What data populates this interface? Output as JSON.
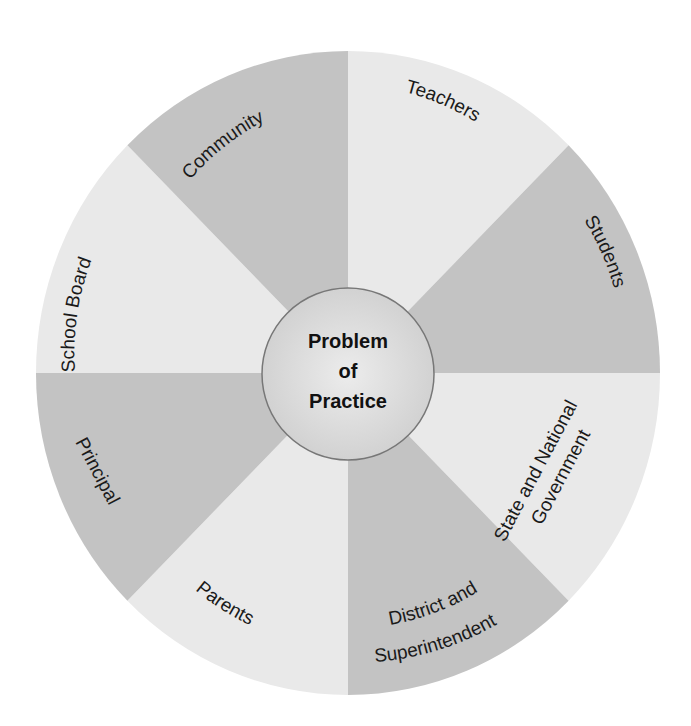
{
  "diagram": {
    "type": "radial-wheel",
    "center_label": {
      "line1": "Problem",
      "line2": "of",
      "line3": "Practice"
    },
    "colors": {
      "dark_wedge": "#c3c3c3",
      "light_wedge": "#e9e9e9",
      "center_fill": "#dcdcdc",
      "center_stroke": "#777777",
      "text": "#1a1a1a"
    },
    "segments": [
      {
        "id": "teachers",
        "label": "Teachers",
        "shade": "light"
      },
      {
        "id": "students",
        "label": "Students",
        "shade": "dark"
      },
      {
        "id": "state",
        "label_line1": "State and National",
        "label_line2": "Government",
        "shade": "light"
      },
      {
        "id": "district",
        "label_line1": "District and",
        "label_line2": "Superintendent",
        "shade": "dark"
      },
      {
        "id": "parents",
        "label": "Parents",
        "shade": "light"
      },
      {
        "id": "principal",
        "label": "Principal",
        "shade": "dark"
      },
      {
        "id": "school-board",
        "label": "School Board",
        "shade": "light"
      },
      {
        "id": "community",
        "label": "Community",
        "shade": "dark"
      }
    ]
  }
}
